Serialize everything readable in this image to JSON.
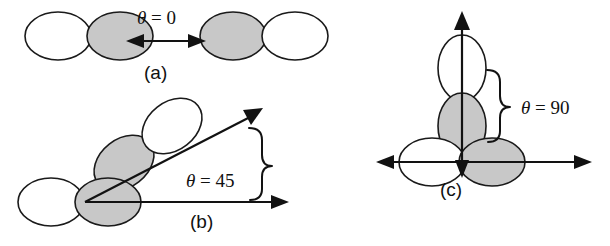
{
  "figure": {
    "background_color": "#ffffff",
    "lobe_outline_color": "#1a1a1a",
    "lobe_filled_color": "#c8c8c8",
    "lobe_empty_color": "#ffffff",
    "axis_color": "#121212",
    "width": 610,
    "height": 246
  },
  "panels": [
    {
      "id": "a",
      "label": "(a)",
      "angle_label_theta": "θ",
      "angle_label_equals": " = ",
      "angle_label_value": "0",
      "angle_label_full": "θ = 0",
      "angle_degrees": 0,
      "arrow_type": "double-headed-horizontal",
      "orbitals": [
        {
          "name": "left-orbital-pair",
          "lobes": [
            {
              "position": "left",
              "fill": "empty"
            },
            {
              "position": "right",
              "fill": "filled"
            }
          ]
        },
        {
          "name": "right-orbital-pair",
          "lobes": [
            {
              "position": "left",
              "fill": "filled"
            },
            {
              "position": "right",
              "fill": "empty"
            }
          ]
        }
      ]
    },
    {
      "id": "b",
      "label": "(b)",
      "angle_label_theta": "θ",
      "angle_label_equals": " = ",
      "angle_label_value": "45",
      "angle_label_full": "θ = 45",
      "angle_degrees": 45,
      "arrow_type": "two-rays-from-origin",
      "has_brace": true,
      "orbitals": [
        {
          "name": "horizontal-orbital-pair",
          "lobes": [
            {
              "position": "left",
              "fill": "empty"
            },
            {
              "position": "right",
              "fill": "filled"
            }
          ]
        },
        {
          "name": "diagonal-orbital-pair",
          "lobes": [
            {
              "position": "lower-left",
              "fill": "filled"
            },
            {
              "position": "upper-right",
              "fill": "empty"
            }
          ]
        }
      ]
    },
    {
      "id": "c",
      "label": "(c)",
      "angle_label_theta": "θ",
      "angle_label_equals": " = ",
      "angle_label_value": "90",
      "angle_label_full": "θ = 90",
      "angle_degrees": 90,
      "arrow_type": "cross-axes",
      "has_brace": true,
      "orbitals": [
        {
          "name": "horizontal-orbital-pair",
          "lobes": [
            {
              "position": "left",
              "fill": "empty"
            },
            {
              "position": "right",
              "fill": "filled"
            }
          ]
        },
        {
          "name": "vertical-orbital-pair",
          "lobes": [
            {
              "position": "top",
              "fill": "empty"
            },
            {
              "position": "bottom",
              "fill": "filled"
            }
          ]
        }
      ]
    }
  ],
  "chart_data": {
    "type": "diagram",
    "categories": [
      "(a)",
      "(b)",
      "(c)"
    ],
    "values": [
      0,
      45,
      90
    ],
    "ylabel": "θ (degrees)",
    "annotations": [
      "θ = 0",
      "θ = 45",
      "θ = 90"
    ]
  }
}
